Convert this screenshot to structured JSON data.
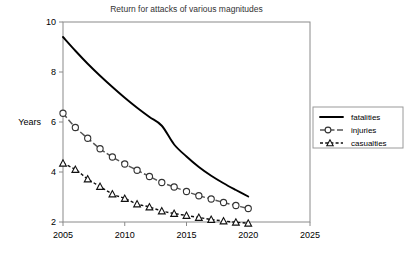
{
  "chart_data": {
    "type": "line",
    "title": "Return for attacks of various magnitudes",
    "xlabel": "",
    "ylabel": "Years",
    "xlim": [
      2005,
      2025
    ],
    "ylim": [
      2,
      10
    ],
    "xticks": [
      2005,
      2010,
      2015,
      2020,
      2025
    ],
    "yticks": [
      2,
      4,
      6,
      8,
      10
    ],
    "xtick_labels": [
      "2005",
      "2010",
      "2015",
      "2020",
      "2025"
    ],
    "ytick_labels": [
      "2",
      "4",
      "6",
      "8",
      "10"
    ],
    "grid": false,
    "legend_position": "right",
    "x": [
      2005,
      2006,
      2007,
      2008,
      2009,
      2010,
      2011,
      2012,
      2013,
      2014,
      2015,
      2016,
      2017,
      2018,
      2019,
      2020
    ],
    "series": [
      {
        "name": "fatalities",
        "style": "solid",
        "marker": "none",
        "color": "#000000",
        "values": [
          9.4,
          8.85,
          8.33,
          7.85,
          7.4,
          6.97,
          6.57,
          6.2,
          5.85,
          5.1,
          4.62,
          4.2,
          3.85,
          3.55,
          3.28,
          3.02
        ]
      },
      {
        "name": "injuries",
        "style": "dashed",
        "marker": "circle",
        "color": "#555555",
        "values": [
          6.35,
          5.78,
          5.35,
          4.93,
          4.6,
          4.32,
          4.07,
          3.82,
          3.58,
          3.4,
          3.22,
          3.05,
          2.92,
          2.78,
          2.66,
          2.54
        ]
      },
      {
        "name": "casualties",
        "style": "dotted",
        "marker": "triangle",
        "color": "#111111",
        "values": [
          4.35,
          4.1,
          3.72,
          3.42,
          3.12,
          2.94,
          2.72,
          2.6,
          2.44,
          2.34,
          2.26,
          2.18,
          2.1,
          2.04,
          1.99,
          1.95
        ]
      }
    ],
    "legend_entries": [
      "fatalities",
      "injuries",
      "casualties"
    ]
  }
}
